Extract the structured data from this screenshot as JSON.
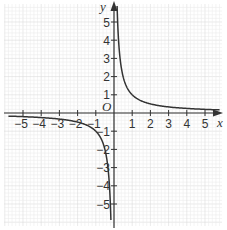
{
  "chart_data": {
    "type": "line",
    "title": "",
    "function": "y = 1/x",
    "xlabel": "x",
    "ylabel": "y",
    "origin_label": "O",
    "xlim": [
      -6,
      6
    ],
    "ylim": [
      -6,
      6
    ],
    "grid": true,
    "x_ticks": [
      -5,
      -4,
      -3,
      -2,
      -1,
      1,
      2,
      3,
      4,
      5
    ],
    "y_ticks": [
      -5,
      -4,
      -3,
      -2,
      -1,
      1,
      2,
      3,
      4,
      5
    ],
    "x_tick_labels": [
      "−5",
      "−4",
      "−3",
      "−2",
      "−1",
      "1",
      "2",
      "3",
      "4",
      "5"
    ],
    "y_tick_labels": [
      "−5",
      "−4",
      "−3",
      "−2",
      "−1",
      "1",
      "2",
      "3",
      "4",
      "5"
    ],
    "series": [
      {
        "name": "y = 1/x (x > 0)",
        "x": [
          0.17,
          0.2,
          0.25,
          0.33,
          0.5,
          0.75,
          1,
          1.5,
          2,
          3,
          4,
          5,
          5.8
        ],
        "y": [
          5.88,
          5,
          4,
          3,
          2,
          1.33,
          1,
          0.67,
          0.5,
          0.33,
          0.25,
          0.2,
          0.17
        ]
      },
      {
        "name": "y = 1/x (x < 0)",
        "x": [
          -5.8,
          -5,
          -4,
          -3,
          -2,
          -1.5,
          -1,
          -0.75,
          -0.5,
          -0.33,
          -0.25,
          -0.2,
          -0.17
        ],
        "y": [
          -0.17,
          -0.2,
          -0.25,
          -0.33,
          -0.5,
          -0.67,
          -1,
          -1.33,
          -2,
          -3,
          -4,
          -5,
          -5.88
        ]
      }
    ],
    "colors": {
      "curve": "#333333",
      "axis": "#333333",
      "grid_minor": "#ececec",
      "grid_major": "#dcdcdc"
    }
  }
}
